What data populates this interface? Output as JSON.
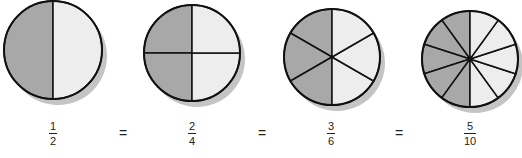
{
  "colors": {
    "shaded": "#a8a8a8",
    "unshaded": "#ededed",
    "outline": "#111111",
    "shadow": "#c4c4c4"
  },
  "circles": [
    {
      "id": "halves",
      "cx": 53,
      "cy": 50,
      "r": 49,
      "parts": 10,
      "divisions": 2,
      "shaded": 1,
      "start_angle": -90
    },
    {
      "id": "quarters",
      "cx": 192,
      "cy": 53,
      "r": 48,
      "divisions": 4,
      "shaded": 2,
      "start_angle": -90
    },
    {
      "id": "sixths",
      "cx": 332,
      "cy": 57,
      "r": 48,
      "divisions": 6,
      "shaded": 3,
      "start_angle": -90
    },
    {
      "id": "tenths",
      "cx": 470,
      "cy": 59,
      "r": 48,
      "divisions": 10,
      "shaded": 5,
      "start_angle": -90
    }
  ],
  "fractions": [
    {
      "numerator": "1",
      "denominator": "2"
    },
    {
      "numerator": "2",
      "denominator": "4"
    },
    {
      "numerator": "3",
      "denominator": "6"
    },
    {
      "numerator": "5",
      "denominator": "10"
    }
  ],
  "equals": [
    "=",
    "=",
    "="
  ]
}
